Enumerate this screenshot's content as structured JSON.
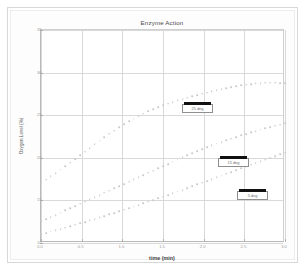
{
  "chart_data": {
    "type": "scatter",
    "title": "Enzyme Action",
    "xlabel": "time (min)",
    "ylabel": "Oxygen Level (%)",
    "xlim": [
      0.0,
      3.0
    ],
    "ylim": [
      10,
      35
    ],
    "xticks": [
      "0.0",
      "0.5",
      "1.0",
      "1.5",
      "2.0",
      "2.5",
      "3.0"
    ],
    "yticks": [
      "35",
      "30",
      "25",
      "20",
      "15",
      "10"
    ],
    "grid": true,
    "legend_position": "inside-annotations",
    "marker": "circle",
    "marker_color": "#c9c9c9",
    "series": [
      {
        "name": "25 deg",
        "label_box": {
          "x": 171,
          "y": 93,
          "w": 31,
          "h": 9
        },
        "x": [
          0.0,
          0.06,
          0.12,
          0.18,
          0.24,
          0.3,
          0.36,
          0.42,
          0.48,
          0.54,
          0.6,
          0.66,
          0.72,
          0.78,
          0.84,
          0.9,
          0.96,
          1.02,
          1.08,
          1.14,
          1.2,
          1.26,
          1.32,
          1.38,
          1.44,
          1.5,
          1.56,
          1.62,
          1.68,
          1.74,
          1.8,
          1.86,
          1.92,
          1.98,
          2.04,
          2.1,
          2.16,
          2.22,
          2.28,
          2.34,
          2.4,
          2.46,
          2.52,
          2.58,
          2.64,
          2.7,
          2.76,
          2.82,
          2.88,
          2.94,
          3.0
        ],
        "y": [
          17.1,
          17.45,
          17.82,
          18.2,
          18.6,
          19.0,
          19.42,
          19.85,
          20.28,
          20.72,
          21.15,
          21.58,
          22.0,
          22.42,
          22.82,
          23.2,
          23.58,
          23.94,
          24.28,
          24.6,
          24.9,
          25.18,
          25.45,
          25.7,
          25.93,
          26.15,
          26.36,
          26.55,
          26.73,
          26.9,
          27.06,
          27.22,
          27.37,
          27.52,
          27.66,
          27.8,
          27.93,
          28.06,
          28.18,
          28.3,
          28.41,
          28.51,
          28.6,
          28.68,
          28.74,
          28.79,
          28.82,
          28.83,
          28.82,
          28.79,
          28.74
        ]
      },
      {
        "name": "15 deg",
        "label_box": {
          "x": 207,
          "y": 147,
          "w": 31,
          "h": 9
        },
        "x": [
          0.0,
          0.06,
          0.12,
          0.18,
          0.24,
          0.3,
          0.36,
          0.42,
          0.48,
          0.54,
          0.6,
          0.66,
          0.72,
          0.78,
          0.84,
          0.9,
          0.96,
          1.02,
          1.08,
          1.14,
          1.2,
          1.26,
          1.32,
          1.38,
          1.44,
          1.5,
          1.56,
          1.62,
          1.68,
          1.74,
          1.8,
          1.86,
          1.92,
          1.98,
          2.04,
          2.1,
          2.16,
          2.22,
          2.28,
          2.34,
          2.4,
          2.46,
          2.52,
          2.58,
          2.64,
          2.7,
          2.76,
          2.82,
          2.88,
          2.94,
          3.0
        ],
        "y": [
          12.55,
          12.8,
          13.05,
          13.3,
          13.56,
          13.82,
          14.08,
          14.34,
          14.6,
          14.86,
          15.12,
          15.38,
          15.64,
          15.9,
          16.16,
          16.42,
          16.68,
          16.94,
          17.2,
          17.46,
          17.72,
          17.98,
          18.24,
          18.5,
          18.76,
          19.02,
          19.28,
          19.54,
          19.8,
          20.06,
          20.32,
          20.56,
          20.8,
          21.02,
          21.24,
          21.45,
          21.66,
          21.86,
          22.06,
          22.25,
          22.44,
          22.62,
          22.8,
          22.97,
          23.14,
          23.3,
          23.46,
          23.61,
          23.76,
          23.9,
          24.04
        ]
      },
      {
        "name": "5 deg",
        "label_box": {
          "x": 226,
          "y": 180,
          "w": 31,
          "h": 9
        },
        "x": [
          0.0,
          0.06,
          0.12,
          0.18,
          0.24,
          0.3,
          0.36,
          0.42,
          0.48,
          0.54,
          0.6,
          0.66,
          0.72,
          0.78,
          0.84,
          0.9,
          0.96,
          1.02,
          1.08,
          1.14,
          1.2,
          1.26,
          1.32,
          1.38,
          1.44,
          1.5,
          1.56,
          1.62,
          1.68,
          1.74,
          1.8,
          1.86,
          1.92,
          1.98,
          2.04,
          2.1,
          2.16,
          2.22,
          2.28,
          2.34,
          2.4,
          2.46,
          2.52,
          2.58,
          2.64,
          2.7,
          2.76,
          2.82,
          2.88,
          2.94,
          3.0
        ],
        "y": [
          11.0,
          11.16,
          11.32,
          11.48,
          11.64,
          11.8,
          11.97,
          12.14,
          12.31,
          12.48,
          12.65,
          12.82,
          13.0,
          13.18,
          13.36,
          13.54,
          13.72,
          13.9,
          14.09,
          14.28,
          14.47,
          14.66,
          14.85,
          15.04,
          15.24,
          15.44,
          15.64,
          15.84,
          16.04,
          16.24,
          16.45,
          16.66,
          16.87,
          17.08,
          17.29,
          17.5,
          17.71,
          17.92,
          18.13,
          18.34,
          18.55,
          18.76,
          18.97,
          19.18,
          19.39,
          19.6,
          19.8,
          20.0,
          20.2,
          20.4,
          20.6
        ]
      }
    ]
  }
}
